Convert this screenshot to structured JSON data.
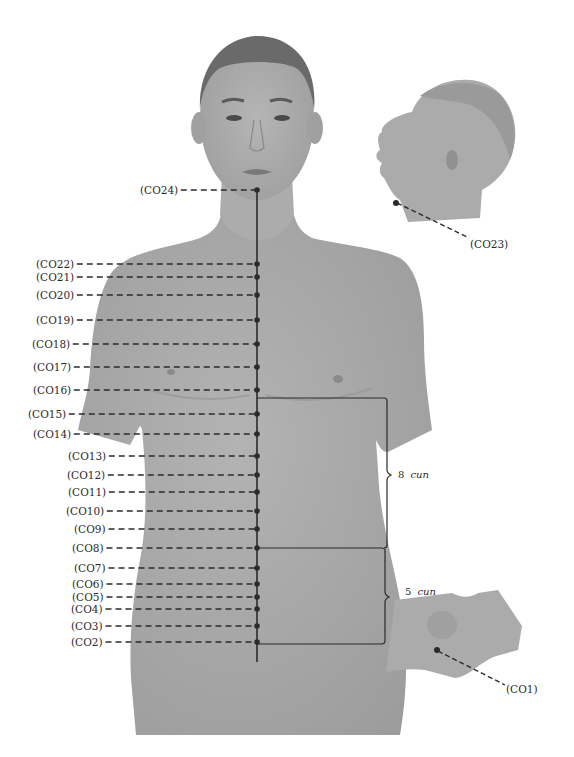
{
  "figure": {
    "colors": {
      "background": "#ffffff",
      "skin": "#a9a9a9",
      "skin_dark": "#8f8f8f",
      "hair": "#5a5a5a",
      "line": "#2b2b2b",
      "text": "#2a2a2a"
    },
    "points": [
      {
        "id": "CO24",
        "label": "(CO24)",
        "y": 190,
        "label_x": 140
      },
      {
        "id": "CO22",
        "label": "(CO22)",
        "y": 264,
        "label_x": 36
      },
      {
        "id": "CO21",
        "label": "(CO21)",
        "y": 277,
        "label_x": 36
      },
      {
        "id": "CO20",
        "label": "(CO20)",
        "y": 295,
        "label_x": 36
      },
      {
        "id": "CO19",
        "label": "(CO19)",
        "y": 320,
        "label_x": 36
      },
      {
        "id": "CO18",
        "label": "(CO18)",
        "y": 344,
        "label_x": 32
      },
      {
        "id": "CO17",
        "label": "(CO17)",
        "y": 367,
        "label_x": 33
      },
      {
        "id": "CO16",
        "label": "(CO16)",
        "y": 390,
        "label_x": 33
      },
      {
        "id": "CO15",
        "label": "(CO15)",
        "y": 414,
        "label_x": 28
      },
      {
        "id": "CO14",
        "label": "(CO14)",
        "y": 434,
        "label_x": 33
      },
      {
        "id": "CO13",
        "label": "(CO13)",
        "y": 456,
        "label_x": 68
      },
      {
        "id": "CO12",
        "label": "(CO12)",
        "y": 475,
        "label_x": 67
      },
      {
        "id": "CO11",
        "label": "(CO11)",
        "y": 492,
        "label_x": 68
      },
      {
        "id": "CO10",
        "label": "(CO10)",
        "y": 511,
        "label_x": 66
      },
      {
        "id": "CO9",
        "label": "(CO9)",
        "y": 529,
        "label_x": 74
      },
      {
        "id": "CO8",
        "label": "(CO8)",
        "y": 548,
        "label_x": 72
      },
      {
        "id": "CO7",
        "label": "(CO7)",
        "y": 568,
        "label_x": 74
      },
      {
        "id": "CO6",
        "label": "(CO6)",
        "y": 584,
        "label_x": 72
      },
      {
        "id": "CO5",
        "label": "(CO5)",
        "y": 597,
        "label_x": 72
      },
      {
        "id": "CO4",
        "label": "(CO4)",
        "y": 609,
        "label_x": 71
      },
      {
        "id": "CO3",
        "label": "(CO3)",
        "y": 626,
        "label_x": 71
      },
      {
        "id": "CO2",
        "label": "(CO2)",
        "y": 642,
        "label_x": 71
      }
    ],
    "side_head": {
      "point_label": "(CO23)"
    },
    "perineum": {
      "point_label": "(CO1)"
    },
    "measurements": [
      {
        "number": "8",
        "unit": "cun",
        "from_point": "CO16/CO15",
        "to_point": "CO8"
      },
      {
        "number": "5",
        "unit": "cun",
        "from_point": "CO8",
        "to_point": "CO2"
      }
    ]
  }
}
